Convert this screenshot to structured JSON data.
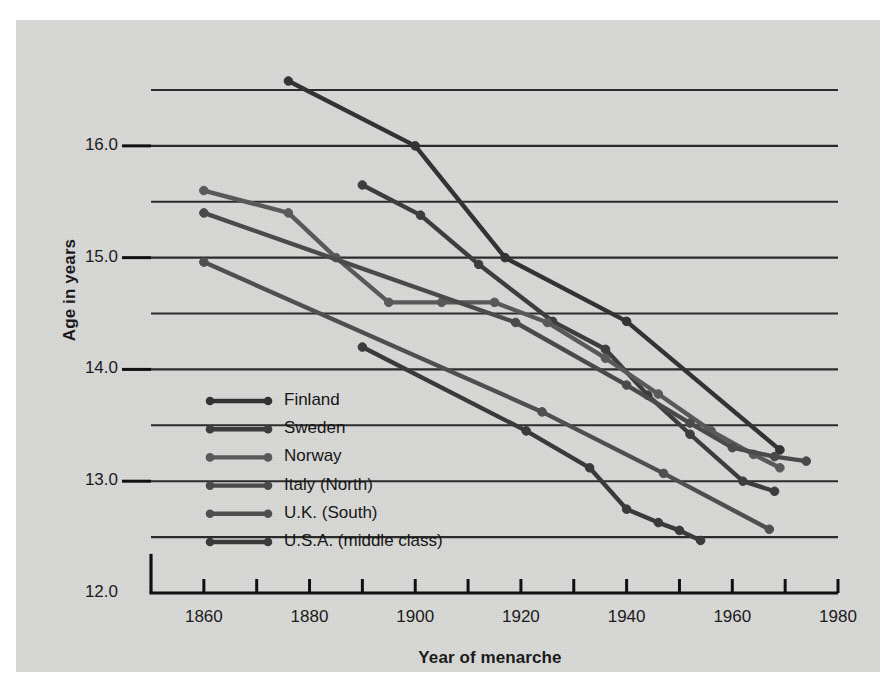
{
  "chart_data": {
    "type": "line",
    "title": "",
    "xlabel": "Year of menarche",
    "ylabel": "Age in years",
    "xlim": [
      1850,
      1980
    ],
    "ylim": [
      12.0,
      16.75
    ],
    "xticks": [
      1860,
      1880,
      1900,
      1920,
      1940,
      1960,
      1980
    ],
    "xtick_labels": [
      "1860",
      "1880",
      "1900",
      "1920",
      "1940",
      "1960",
      "1980"
    ],
    "xtick_minor_step": 10,
    "yticks": [
      12.0,
      13.0,
      14.0,
      15.0,
      16.0
    ],
    "ytick_labels": [
      "12.0",
      "13.0",
      "14.0",
      "15.0",
      "16.0"
    ],
    "gridlines": [
      12.5,
      13.0,
      13.5,
      14.0,
      14.5,
      15.0,
      15.5,
      16.0,
      16.5
    ],
    "grid": true,
    "legend_position": "lower-left-inside",
    "series": [
      {
        "name": "Finland",
        "color": "#333333",
        "points": [
          {
            "x": 1876,
            "y": 16.58
          },
          {
            "x": 1900,
            "y": 16.0
          },
          {
            "x": 1917,
            "y": 15.0
          },
          {
            "x": 1940,
            "y": 14.43
          },
          {
            "x": 1969,
            "y": 13.28
          }
        ]
      },
      {
        "name": "Sweden",
        "color": "#3d3d3d",
        "points": [
          {
            "x": 1890,
            "y": 15.65
          },
          {
            "x": 1901,
            "y": 15.38
          },
          {
            "x": 1912,
            "y": 14.94
          },
          {
            "x": 1926,
            "y": 14.43
          },
          {
            "x": 1936,
            "y": 14.18
          },
          {
            "x": 1944,
            "y": 13.77
          },
          {
            "x": 1952,
            "y": 13.42
          },
          {
            "x": 1962,
            "y": 13.0
          },
          {
            "x": 1968,
            "y": 12.91
          }
        ]
      },
      {
        "name": "Norway",
        "color": "#595959",
        "points": [
          {
            "x": 1860,
            "y": 15.6
          },
          {
            "x": 1876,
            "y": 15.4
          },
          {
            "x": 1885,
            "y": 15.0
          },
          {
            "x": 1895,
            "y": 14.6
          },
          {
            "x": 1905,
            "y": 14.6
          },
          {
            "x": 1915,
            "y": 14.6
          },
          {
            "x": 1925,
            "y": 14.42
          },
          {
            "x": 1936,
            "y": 14.1
          },
          {
            "x": 1946,
            "y": 13.78
          },
          {
            "x": 1956,
            "y": 13.45
          },
          {
            "x": 1964,
            "y": 13.24
          },
          {
            "x": 1969,
            "y": 13.12
          }
        ]
      },
      {
        "name": "Italy (North)",
        "color": "#4a4a4a",
        "points": [
          {
            "x": 1860,
            "y": 15.4
          },
          {
            "x": 1919,
            "y": 14.42
          },
          {
            "x": 1940,
            "y": 13.86
          },
          {
            "x": 1952,
            "y": 13.52
          },
          {
            "x": 1960,
            "y": 13.3
          },
          {
            "x": 1968,
            "y": 13.22
          },
          {
            "x": 1974,
            "y": 13.18
          }
        ]
      },
      {
        "name": "U.K. (South)",
        "color": "#4f4f4f",
        "points": [
          {
            "x": 1860,
            "y": 14.96
          },
          {
            "x": 1924,
            "y": 13.62
          },
          {
            "x": 1947,
            "y": 13.07
          },
          {
            "x": 1967,
            "y": 12.57
          }
        ]
      },
      {
        "name": "U.S.A. (middle class)",
        "color": "#3a3a3a",
        "points": [
          {
            "x": 1890,
            "y": 14.2
          },
          {
            "x": 1921,
            "y": 13.45
          },
          {
            "x": 1933,
            "y": 13.12
          },
          {
            "x": 1940,
            "y": 12.75
          },
          {
            "x": 1946,
            "y": 12.63
          },
          {
            "x": 1950,
            "y": 12.56
          },
          {
            "x": 1954,
            "y": 12.47
          }
        ]
      }
    ]
  },
  "legend": {
    "items": [
      {
        "label": "Finland"
      },
      {
        "label": "Sweden"
      },
      {
        "label": "Norway"
      },
      {
        "label": "Italy (North)"
      },
      {
        "label": "U.K. (South)"
      },
      {
        "label": "U.S.A. (middle class)"
      }
    ]
  },
  "colors": {
    "panel_background": "#d9d9d7",
    "axis": "#111111",
    "gridline": "#2b2b2b",
    "text": "#1b1b1b"
  }
}
